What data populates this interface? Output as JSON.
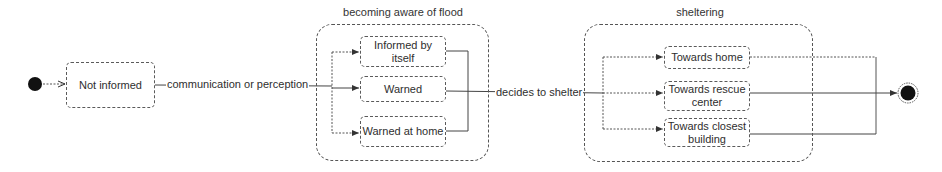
{
  "diagram": {
    "type": "UML state machine",
    "initial_state": {
      "name": "initial"
    },
    "final_state": {
      "name": "final"
    },
    "states": {
      "not_informed": "Not informed"
    },
    "composites": {
      "aware": {
        "title": "becoming aware of flood",
        "substates": [
          "Informed by itself",
          "Warned",
          "Warned at home"
        ]
      },
      "sheltering": {
        "title": "sheltering",
        "substates": [
          "Towards home",
          "Towards rescue center",
          "Towards closest building"
        ]
      }
    },
    "transitions": {
      "t1": "communication or perception",
      "t2": "decides to shelter"
    },
    "colors": {
      "line": "#4a4a4a",
      "fill": "#111111",
      "background": "#ffffff"
    }
  }
}
